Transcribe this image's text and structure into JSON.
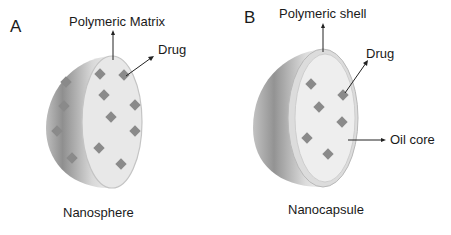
{
  "panels": [
    {
      "letter": "A",
      "title": "Nanosphere",
      "labels": {
        "top": "Polymeric Matrix",
        "drug": "Drug"
      }
    },
    {
      "letter": "B",
      "title": "Nanocapsule",
      "labels": {
        "top": "Polymeric shell",
        "drug": "Drug",
        "core": "Oil core"
      }
    }
  ],
  "colors": {
    "shell_dark": "#8e8e8e",
    "shell_light": "#e6e6e6",
    "cut_face": "#e9e9e9",
    "drug": "#8a8a8a",
    "text": "#1a1a1a"
  }
}
